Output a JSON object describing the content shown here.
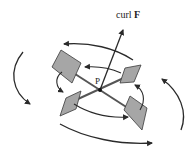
{
  "figure": {
    "type": "paddle-wheel curl illustration",
    "labels": {
      "curl_text": "curl",
      "curl_vector": "F",
      "point": "P"
    },
    "colors": {
      "stroke": "#2a2a2a",
      "paddle_fill": "#a6a6a6",
      "paddle_stroke": "#3a3a3a",
      "axle": "#555555",
      "background": "#ffffff"
    },
    "elements": {
      "curl_vector": {
        "from": [
          100,
          90
        ],
        "to": [
          124,
          27
        ]
      },
      "paddles": [
        {
          "name": "top-left",
          "points": [
            [
              52,
              67
            ],
            [
              61,
              50
            ],
            [
              81,
              63
            ],
            [
              72,
              83
            ]
          ]
        },
        {
          "name": "top-right",
          "points": [
            [
              120,
              83
            ],
            [
              125,
              68
            ],
            [
              141,
              65
            ],
            [
              134,
              82
            ]
          ]
        },
        {
          "name": "bottom-left",
          "points": [
            [
              60,
              116
            ],
            [
              66,
              98
            ],
            [
              81,
              91
            ],
            [
              76,
              109
            ]
          ]
        },
        {
          "name": "bottom-right",
          "points": [
            [
              124,
              110
            ],
            [
              130,
              96
            ],
            [
              147,
              108
            ],
            [
              142,
              130
            ]
          ]
        }
      ],
      "rotation_arrows": 8
    }
  }
}
